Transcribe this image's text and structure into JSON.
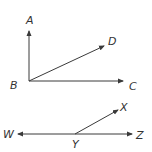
{
  "diagram": {
    "colors": {
      "line": "#3a3a3a",
      "text": "#333333",
      "background": "#ffffff"
    },
    "figure1": {
      "vertex": {
        "label": "B",
        "x": 29,
        "y": 81
      },
      "rays": [
        {
          "label": "A",
          "to": [
            29,
            31
          ]
        },
        {
          "label": "D",
          "to": [
            104,
            46
          ]
        },
        {
          "label": "C",
          "to": [
            123,
            81
          ]
        }
      ]
    },
    "figure2": {
      "vertex": {
        "label": "Y",
        "x": 75,
        "y": 134
      },
      "rays": [
        {
          "label": "X",
          "to": [
            118,
            110
          ]
        },
        {
          "label": "W",
          "to": [
            18,
            134
          ]
        },
        {
          "label": "Z",
          "to": [
            132,
            134
          ]
        }
      ]
    },
    "labels": {
      "A": "A",
      "B": "B",
      "C": "C",
      "D": "D",
      "W": "W",
      "X": "X",
      "Y": "Y",
      "Z": "Z"
    }
  }
}
